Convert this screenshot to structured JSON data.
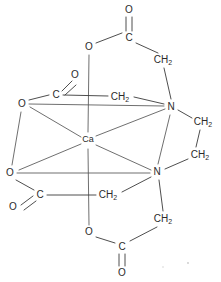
{
  "figure": {
    "type": "chemical-structure-diagram",
    "background_color": "#ffffff",
    "bond_color": "#3a3a3a",
    "label_color": "#2b2b2b"
  },
  "atoms": {
    "metal_center": {
      "label": "Ca",
      "x": 88,
      "y": 140
    },
    "nitrogen_upper": {
      "label": "N",
      "x": 171,
      "y": 107
    },
    "nitrogen_lower": {
      "label": "N",
      "x": 157,
      "y": 172
    },
    "oxygen_coord_upper_left": {
      "label": "O",
      "x": 22,
      "y": 104
    },
    "oxygen_coord_lower_left": {
      "label": "O",
      "x": 10,
      "y": 173
    },
    "oxygen_ester_top": {
      "label": "O",
      "x": 89,
      "y": 47
    },
    "oxygen_ester_bottom": {
      "label": "O",
      "x": 89,
      "y": 232
    },
    "oxygen_carbonyl_top": {
      "label": "O",
      "x": 129,
      "y": 10
    },
    "oxygen_carbonyl_bottom": {
      "label": "O",
      "x": 122,
      "y": 273
    },
    "oxygen_carbonyl_upper_left": {
      "label": "O",
      "x": 75,
      "y": 75
    },
    "oxygen_carbonyl_lower_left": {
      "label": "O",
      "x": 13,
      "y": 207
    },
    "carbon_top": {
      "label": "C",
      "x": 129,
      "y": 38
    },
    "carbon_bottom": {
      "label": "C",
      "x": 122,
      "y": 247
    },
    "carbon_upper_left": {
      "label": "C",
      "x": 56,
      "y": 95
    },
    "carbon_lower_left": {
      "label": "C",
      "x": 40,
      "y": 195
    },
    "methylene_upper_center": {
      "label": "CH",
      "sub": "2",
      "x": 120,
      "y": 97
    },
    "methylene_upper_right": {
      "label": "CH",
      "sub": "2",
      "x": 163,
      "y": 60
    },
    "methylene_bridge_top": {
      "label": "CH",
      "sub": "2",
      "x": 203,
      "y": 122
    },
    "methylene_bridge_bottom": {
      "label": "CH",
      "sub": "2",
      "x": 200,
      "y": 155
    },
    "methylene_lower_center": {
      "label": "CH",
      "sub": "2",
      "x": 108,
      "y": 195
    },
    "methylene_lower_right": {
      "label": "CH",
      "sub": "2",
      "x": 163,
      "y": 219
    }
  },
  "labels": {
    "metal": "Ca",
    "nitrogen": "N",
    "oxygen": "O",
    "carbon": "C",
    "methylene": "CH",
    "methylene_subscript": "2"
  }
}
